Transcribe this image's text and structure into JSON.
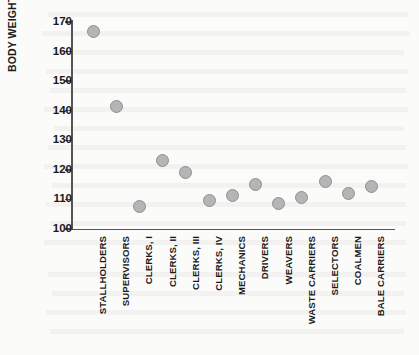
{
  "chart_data": {
    "type": "scatter",
    "title": "",
    "xlabel": "",
    "ylabel": "BODY WEIGHT (LBS.)",
    "ylim": [
      100,
      170
    ],
    "yticks": [
      100,
      110,
      120,
      130,
      140,
      150,
      160,
      170
    ],
    "grid": false,
    "legend": null,
    "marker_color": "#b5b5b5",
    "marker_edge_color": "#8f8f8f",
    "axis_color": "#555555",
    "categories": [
      "STALLHOLDERS",
      "SUPERVISORS",
      "CLERKS, I",
      "CLERKS, II",
      "CLERKS, III",
      "CLERKS, IV",
      "MECHANICS",
      "DRIVERS",
      "WEAVERS",
      "WASTE CARRIERS",
      "SELECTORS",
      "COALMEN",
      "BALE CARRIERS"
    ],
    "values": [
      166.7,
      141.3,
      107.5,
      123.3,
      119.2,
      109.5,
      111.3,
      115.0,
      108.5,
      110.8,
      116.0,
      112.0,
      114.5
    ]
  }
}
